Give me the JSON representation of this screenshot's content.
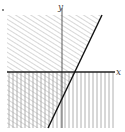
{
  "diagram": {
    "type": "inequality-region-graph",
    "axes": {
      "x_label": "x",
      "y_label": "y"
    },
    "regions": [
      {
        "name": "left-of-line",
        "hatch": "diagonal",
        "description": "region to the left of the oblique line"
      },
      {
        "name": "below-x-axis",
        "hatch": "vertical",
        "description": "region below the x-axis (y < 0)"
      }
    ],
    "boundary_line": {
      "description": "oblique line with positive slope crossing x-axis right of origin"
    },
    "colors": {
      "hatch": "#9a9a9a",
      "axis": "#333333",
      "boundary": "#111111"
    }
  }
}
